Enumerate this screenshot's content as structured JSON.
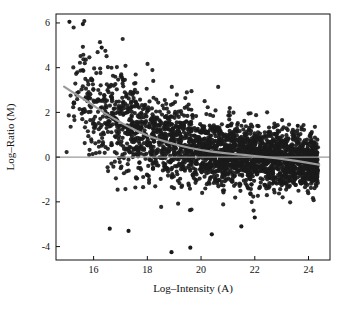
{
  "chart_data": {
    "type": "scatter",
    "title": "",
    "xlabel": "Log–Intensity (A)",
    "ylabel": "Log–Ratio (M)",
    "xlim": [
      14.6,
      24.8
    ],
    "ylim": [
      -4.6,
      6.4
    ],
    "xticks": [
      16,
      18,
      20,
      22,
      24
    ],
    "xtick_labels": [
      "16",
      "18",
      "20",
      "22",
      "24"
    ],
    "yticks": [
      -4,
      -2,
      0,
      2,
      4,
      6
    ],
    "ytick_labels": [
      "-4",
      "-2",
      "0",
      "2",
      "4",
      "6"
    ],
    "grid": false,
    "legend": "none",
    "point_color": "#1a1a1a",
    "point_size": 2.1,
    "reference_line": {
      "y": 0,
      "color": "#9a9a9a",
      "style": "solid"
    },
    "loess_curve": {
      "name": "loess fit",
      "color": "#9a9a9a",
      "width": 2.2,
      "x": [
        14.9,
        15.2,
        15.6,
        16.0,
        16.4,
        16.8,
        17.2,
        17.6,
        18.0,
        18.4,
        18.8,
        19.2,
        19.6,
        20.0,
        20.4,
        20.8,
        21.2,
        21.6,
        22.0,
        22.4,
        22.8,
        23.2,
        23.6,
        24.0,
        24.4
      ],
      "y": [
        3.15,
        2.92,
        2.62,
        2.3,
        1.98,
        1.69,
        1.42,
        1.18,
        0.97,
        0.8,
        0.65,
        0.52,
        0.41,
        0.32,
        0.25,
        0.19,
        0.14,
        0.1,
        0.05,
        0.0,
        -0.05,
        -0.11,
        -0.18,
        -0.26,
        -0.34
      ]
    },
    "series": [
      {
        "name": "genes",
        "n_points": 2800,
        "description": "MA-plot cloud: dense band of log-ratios centred near 0 for high intensities, fanning upward and positive at low intensities",
        "x_range": [
          14.8,
          24.5
        ],
        "y_range": [
          -4.3,
          6.1
        ]
      }
    ]
  }
}
